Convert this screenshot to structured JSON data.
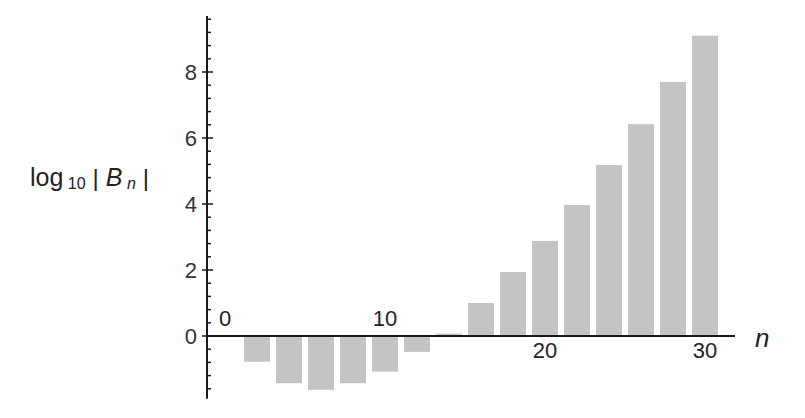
{
  "chart_data": {
    "type": "bar",
    "title": "",
    "xlabel": "n",
    "ylabel": "log10 |B_n|",
    "ylabel_parts": {
      "log": "log",
      "base": "10",
      "bar_left": "|",
      "B": "B",
      "n": "n",
      "bar_right": "|"
    },
    "x": [
      2,
      4,
      6,
      8,
      10,
      12,
      14,
      16,
      18,
      20,
      22,
      24,
      26,
      28,
      30
    ],
    "values": [
      -0.75,
      -1.4,
      -1.6,
      -1.4,
      -1.05,
      -0.45,
      0.07,
      1.0,
      1.94,
      2.88,
      3.97,
      5.18,
      6.42,
      7.7,
      9.1
    ],
    "xticks": [
      {
        "value": 0,
        "label": "0",
        "pos": "above"
      },
      {
        "value": 10,
        "label": "10",
        "pos": "above"
      },
      {
        "value": 20,
        "label": "20",
        "pos": "below"
      },
      {
        "value": 30,
        "label": "30",
        "pos": "below"
      }
    ],
    "yticks": [
      0,
      2,
      4,
      6,
      8
    ],
    "ytick_labels": [
      "0",
      "2",
      "4",
      "6",
      "8"
    ],
    "yminor_step": 0.4,
    "xlim": [
      -1,
      32
    ],
    "ylim": [
      -1.9,
      9.7
    ],
    "grid": false,
    "legend": null,
    "bar_color": "#c4c4c4",
    "axis_color": "#1a1a1a"
  }
}
